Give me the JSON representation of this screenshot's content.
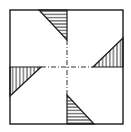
{
  "diagram": {
    "stroke_color": "#1a1a1a",
    "background": "#ffffff",
    "square": {
      "x": 10,
      "y": 10,
      "w": 113,
      "h": 114
    },
    "center": {
      "x": 67,
      "y": 67
    },
    "triangles": [
      {
        "name": "top",
        "points": "39,10 67,10 67,40",
        "hatch": "horizontal"
      },
      {
        "name": "right",
        "points": "93,67 123,67 123,38",
        "hatch": "vertical"
      },
      {
        "name": "bottom",
        "points": "67,95 67,124 94,124",
        "hatch": "horizontal"
      },
      {
        "name": "left",
        "points": "10,67 41,67 10,96",
        "hatch": "vertical"
      }
    ]
  }
}
